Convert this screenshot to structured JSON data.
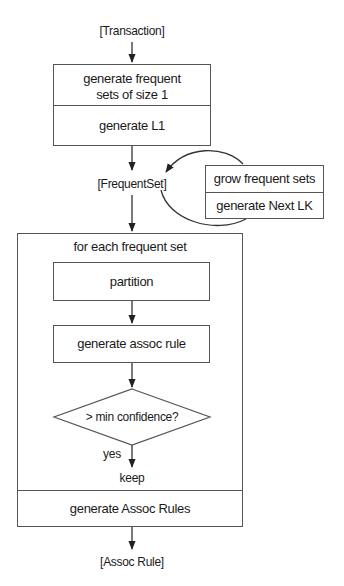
{
  "diagram": {
    "input_label": "[Transaction]",
    "init_box": {
      "top_text": "generate frequent\nsets of size 1",
      "bottom_text": "generate L1"
    },
    "frequent_set_label": "[FrequentSet]",
    "grow_box": {
      "top_text": "grow frequent sets",
      "bottom_text": "generate Next LK"
    },
    "loop_box": {
      "header": "for each frequent set",
      "partition": "partition",
      "generate_rule": "generate assoc rule",
      "decision": "> min confidence?",
      "yes_label": "yes",
      "keep_label": "keep",
      "footer": "generate Assoc Rules"
    },
    "output_label": "[Assoc Rule]"
  },
  "colors": {
    "line": "#555555",
    "text": "#1a1a1a",
    "background": "#ffffff"
  }
}
